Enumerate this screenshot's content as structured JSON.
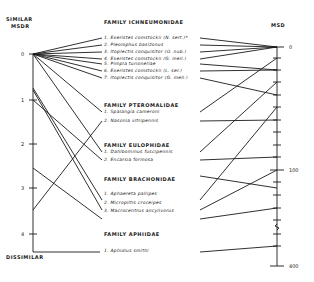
{
  "left_axis": {
    "title_top": "SIMILAR",
    "title_sub": "MSDR",
    "title_bottom": "DISSIMILAR",
    "ticks": [
      "0",
      "1",
      "2",
      "3",
      "4"
    ]
  },
  "right_axis": {
    "title": "MSD",
    "ticks": [
      "0",
      "100",
      "400"
    ]
  },
  "families": [
    {
      "name": "FAMILY ICHNEUMONIDAE",
      "species": [
        "1. Exeristes comstockii (N. sert.)*",
        "2. Pleolophus basizonus",
        "3. Itoplectis conquisitor (O. nub.)",
        "4. Exeristes comstockii (G. mell.)",
        "5. Pimpla turionellae",
        "6. Exeristes comstockii (L. ser.)",
        "7. Itoplectis conquisitor (G. mell.)"
      ]
    },
    {
      "name": "FAMILY PTEROMALIDAE",
      "species": [
        "1. Spalangia cameroni",
        "2. Nasonia vitripennis"
      ]
    },
    {
      "name": "FAMILY EULOPHIDAE",
      "species": [
        "1. Dahlbominus fuscipennis",
        "2. Encarsia formosa"
      ]
    },
    {
      "name": "FAMILY BRACHONIDAE",
      "species": [
        "1. Aphaereta pallipes",
        "2. Microplitis croceipes",
        "3. Macrocentrus ancylivorus"
      ]
    },
    {
      "name": "FAMILY APHIIDAE",
      "species": [
        "1. Aphidius smithi"
      ]
    }
  ],
  "colors": {
    "ink": "#1a1a1a",
    "background": "#ffffff"
  }
}
